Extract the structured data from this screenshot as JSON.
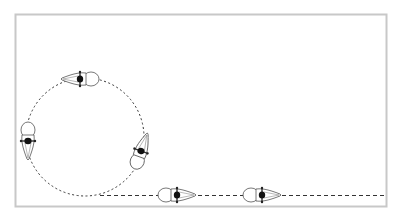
{
  "diagram": {
    "type": "path-diagram",
    "frame": {
      "x": 15,
      "y": 14,
      "width": 371,
      "height": 192,
      "stroke": "#c8c8c8"
    },
    "circle_path": {
      "cx": 85,
      "cy": 137,
      "r": 59,
      "stroke": "#333333",
      "style": "dotted"
    },
    "straight_path": {
      "x1": 100,
      "y1": 195,
      "x2": 386,
      "y2": 195,
      "stroke": "#333333",
      "style": "dashed"
    },
    "figures": [
      {
        "id": "top",
        "x": 80,
        "y": 79,
        "rotation": 180
      },
      {
        "id": "left",
        "x": 28,
        "y": 141,
        "rotation": 90
      },
      {
        "id": "right",
        "x": 141,
        "y": 151,
        "rotation": -70
      },
      {
        "id": "bottom-1",
        "x": 177,
        "y": 195,
        "rotation": 0
      },
      {
        "id": "bottom-2",
        "x": 262,
        "y": 195,
        "rotation": 0
      }
    ]
  }
}
